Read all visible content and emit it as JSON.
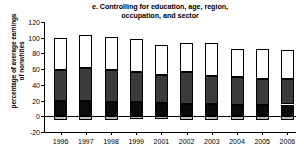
{
  "chart_data": {
    "type": "bar",
    "title": "e. Controlling for education, age, region, occupation, and sector",
    "title_line1": "e. Controlling for education, age, region,",
    "title_line2": "occupation, and sector",
    "xlabel": "",
    "ylabel": "percentage of average earnings of nonwhites",
    "ylabel_line1": "percentage of average earnings",
    "ylabel_line2": "of nonwhites",
    "categories": [
      "1996",
      "1997",
      "1998",
      "1999",
      "2001",
      "2002",
      "2003",
      "2004",
      "2005",
      "2006"
    ],
    "ylim": [
      -20,
      120
    ],
    "yticks": [
      120,
      100,
      80,
      60,
      40,
      20,
      0,
      -20
    ],
    "ytick_labels": [
      "120",
      "100",
      "80",
      "60",
      "40",
      "20",
      "0",
      "-20"
    ],
    "grid": false,
    "legend": "none",
    "stacked": true,
    "series": [
      {
        "name": "segment-black",
        "color": "#0a0a0a",
        "values": [
          19,
          19,
          18,
          18,
          17,
          16,
          16,
          15,
          14,
          15
        ]
      },
      {
        "name": "segment-dark-gray",
        "color": "#3b3b3b",
        "values": [
          40,
          43,
          41,
          39,
          36,
          40,
          35,
          35,
          34,
          32
        ]
      },
      {
        "name": "segment-white",
        "color": "#ffffff",
        "values": [
          41,
          41,
          42,
          42,
          38,
          37,
          42,
          36,
          38,
          37
        ]
      },
      {
        "name": "segment-negative-gray",
        "color": "#b9b9b9",
        "values": [
          -5,
          -5,
          -5,
          -4,
          -4,
          -5,
          -5,
          -5,
          -5,
          -5
        ]
      }
    ],
    "bar_totals": [
      100,
      103,
      101,
      99,
      91,
      93,
      93,
      86,
      86,
      84
    ]
  }
}
